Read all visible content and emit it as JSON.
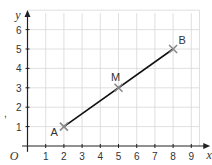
{
  "chart_data": {
    "type": "line",
    "title": "",
    "xlabel": "x",
    "ylabel": "y",
    "origin_label": "O",
    "xlim": [
      0,
      9.6
    ],
    "ylim": [
      0,
      6.7
    ],
    "x_ticks": [
      1,
      2,
      3,
      4,
      5,
      6,
      7,
      8,
      9
    ],
    "y_ticks": [
      1,
      2,
      3,
      4,
      5,
      6
    ],
    "grid": true,
    "colors": {
      "grid": "#d8d8d8",
      "axis": "#222222",
      "line": "#111111",
      "marker": "#888888"
    },
    "segment": {
      "from": "A",
      "to": "B"
    },
    "points": [
      {
        "label": "A",
        "x": 2,
        "y": 1,
        "label_pos": "left"
      },
      {
        "label": "M",
        "x": 5,
        "y": 3,
        "label_pos": "top"
      },
      {
        "label": "B",
        "x": 8,
        "y": 5,
        "label_pos": "top-right"
      }
    ],
    "margin_mark": ","
  }
}
